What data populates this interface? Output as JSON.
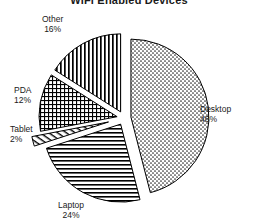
{
  "chart_data": {
    "type": "pie",
    "title": "WiFi Enabled Devices",
    "xlabel": "",
    "ylabel": "",
    "legend_position": "none",
    "grid": false,
    "exploded": true,
    "units": "percent",
    "categories": [
      "Desktop",
      "Laptop",
      "Tablet",
      "PDA",
      "Other"
    ],
    "values": [
      46,
      24,
      2,
      12,
      16
    ],
    "slices": [
      {
        "label": "Desktop",
        "value": 46,
        "value_text": "46%",
        "pattern": "stipple-dots",
        "color": "#9a9a9a",
        "start_angle_deg": 0,
        "end_angle_deg": 165.6
      },
      {
        "label": "Laptop",
        "value": 24,
        "value_text": "24%",
        "pattern": "horizontal-lines",
        "color": "#6e6e6e",
        "start_angle_deg": 165.6,
        "end_angle_deg": 252.0
      },
      {
        "label": "Tablet",
        "value": 2,
        "value_text": "2%",
        "pattern": "diagonal-lines",
        "color": "#808080",
        "start_angle_deg": 252.0,
        "end_angle_deg": 259.2
      },
      {
        "label": "PDA",
        "value": 12,
        "value_text": "12%",
        "pattern": "crosshatch-grid",
        "color": "#5a5a5a",
        "start_angle_deg": 259.2,
        "end_angle_deg": 302.4
      },
      {
        "label": "Other",
        "value": 16,
        "value_text": "16%",
        "pattern": "vertical-lines",
        "color": "#4a4a4a",
        "start_angle_deg": 302.4,
        "end_angle_deg": 360.0
      }
    ],
    "style": {
      "background": "#ffffff",
      "outline": "#000000",
      "text": "#1a1a1a"
    }
  }
}
